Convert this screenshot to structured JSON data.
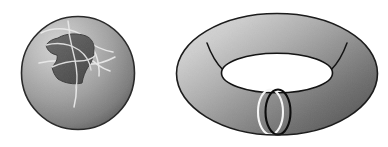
{
  "figure": {
    "title": "Sphere with coordinate patch and torus with curves",
    "background_color": "#ffffff",
    "width": 388,
    "height": 147,
    "objects": [
      {
        "name": "sphere",
        "label": "sphere",
        "center_x": 78,
        "center_y": 73,
        "radius": 57,
        "shading": "radial-gradient",
        "highlight_x": 52,
        "highlight_y": 40,
        "color_light": "#c9c9c9",
        "color_mid": "#9a9a9a",
        "color_dark": "#5e5e5e",
        "outline_color": "#2b2b2b",
        "patch": {
          "name": "coordinate-patch",
          "fill_color": "#5a5a5a",
          "edge_color": "#3a3a3a"
        },
        "curves": {
          "name": "parameter-curves",
          "stroke_color": "#e8e8e8",
          "count": 4
        }
      },
      {
        "name": "torus",
        "label": "torus",
        "center_x": 277,
        "center_y": 74,
        "outer_rx": 101,
        "outer_ry": 61,
        "hole_rx": 55,
        "hole_ry": 20,
        "hole_color": "#ffffff",
        "color_light": "#d2d2d2",
        "color_mid": "#9d9d9d",
        "color_dark": "#575757",
        "outline_color": "#1e1e1e",
        "meridian_left": {
          "name": "meridian-arc-left",
          "stroke_color": "#141414"
        },
        "meridian_right": {
          "name": "meridian-arc-right",
          "stroke_color": "#141414"
        },
        "meridian_front_black": {
          "name": "meridian-circle-black",
          "stroke_color": "#0a0a0a",
          "center_x": 277,
          "center_y": 113,
          "rx": 13,
          "ry": 23
        },
        "meridian_front_white": {
          "name": "meridian-circle-white",
          "stroke_color": "#f6f6f6",
          "center_x": 271,
          "center_y": 113,
          "rx": 13,
          "ry": 23
        }
      }
    ]
  }
}
